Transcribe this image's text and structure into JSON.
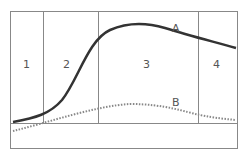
{
  "diagram": {
    "type": "growth-curve phases",
    "phase_labels": [
      "1",
      "2",
      "3",
      "4"
    ],
    "curves": [
      {
        "label": "A",
        "style": "solid",
        "color": "#333333"
      },
      {
        "label": "B",
        "style": "dotted",
        "color": "#888888"
      }
    ],
    "colors": {
      "frame": "#888888",
      "curve_a": "#333333",
      "curve_b": "#888888",
      "text": "#555555"
    }
  }
}
